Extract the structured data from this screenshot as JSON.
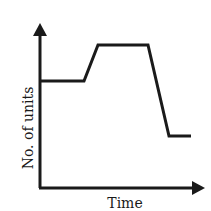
{
  "chart_data": {
    "type": "line",
    "title": "",
    "xlabel": "Time",
    "ylabel": "No. of units",
    "grid": false,
    "legend": null,
    "ticks": {
      "x": [],
      "y": []
    },
    "series": [
      {
        "name": "No. of units",
        "color": "#1a1a1a",
        "points_px": [
          [
            40,
            81
          ],
          [
            84,
            81
          ],
          [
            98,
            45
          ],
          [
            148,
            45
          ],
          [
            169,
            136
          ],
          [
            191,
            136
          ]
        ],
        "description": "Constant level, rises to a higher plateau, stays constant, then falls to a lower level below the starting level and remains constant"
      }
    ],
    "axes": {
      "origin_px": [
        40,
        188
      ],
      "y_arrow_tip_px": [
        40,
        24
      ],
      "x_arrow_tip_px": [
        204,
        188
      ]
    }
  },
  "labels": {
    "x_axis": "Time",
    "y_axis": "No. of units"
  },
  "colors": {
    "ink": "#1a1a1a",
    "background": "#ffffff"
  }
}
